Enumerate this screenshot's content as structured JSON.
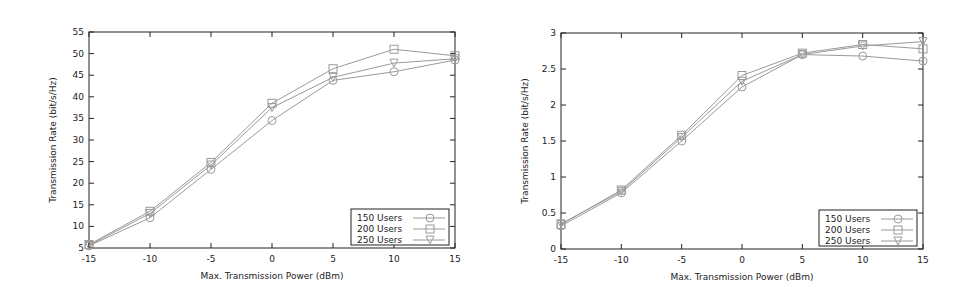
{
  "chart_data": [
    {
      "type": "line",
      "title": "",
      "xlabel": "Max. Transmission Power (dBm)",
      "ylabel": "Transmission Rate (bit/s/Hz)",
      "x": [
        -15,
        -10,
        -5,
        0,
        5,
        10,
        15
      ],
      "xticks": [
        "-15",
        "-10",
        "-5",
        "0",
        "5",
        "10",
        "15"
      ],
      "yticks": [
        "5",
        "10",
        "15",
        "20",
        "25",
        "30",
        "35",
        "40",
        "45",
        "50",
        "55"
      ],
      "xlim": [
        -15,
        15
      ],
      "ylim": [
        5,
        55
      ],
      "grid": false,
      "legend_position": "lower right",
      "series": [
        {
          "name": "150 Users",
          "marker": "circle",
          "values": [
            5.5,
            12.0,
            23.2,
            34.5,
            43.8,
            45.8,
            48.5
          ]
        },
        {
          "name": "200 Users",
          "marker": "square",
          "values": [
            5.8,
            13.5,
            24.8,
            38.5,
            46.5,
            51.0,
            49.5
          ]
        },
        {
          "name": "250 Users",
          "marker": "triangle-down",
          "values": [
            5.6,
            13.0,
            24.2,
            37.5,
            44.5,
            47.8,
            48.8
          ]
        }
      ]
    },
    {
      "type": "line",
      "title": "",
      "xlabel": "Max. Transmission Power (dBm)",
      "ylabel": "Transmission Rate (bit/s/Hz)",
      "x": [
        -15,
        -10,
        -5,
        0,
        5,
        10,
        15
      ],
      "xticks": [
        "-15",
        "-10",
        "-5",
        "0",
        "5",
        "10",
        "15"
      ],
      "yticks": [
        "0",
        "0.5",
        "1",
        "1.5",
        "2",
        "2.5",
        "3"
      ],
      "xlim": [
        -15,
        15
      ],
      "ylim": [
        0,
        3
      ],
      "grid": false,
      "legend_position": "lower right",
      "series": [
        {
          "name": "150 Users",
          "marker": "circle",
          "values": [
            0.32,
            0.78,
            1.5,
            2.25,
            2.7,
            2.68,
            2.61
          ]
        },
        {
          "name": "200 Users",
          "marker": "square",
          "values": [
            0.34,
            0.82,
            1.58,
            2.41,
            2.72,
            2.84,
            2.78
          ]
        },
        {
          "name": "250 Users",
          "marker": "triangle-down",
          "values": [
            0.35,
            0.8,
            1.55,
            2.33,
            2.7,
            2.82,
            2.88
          ]
        }
      ]
    }
  ],
  "colors": {
    "line": "#9a9a9a",
    "frame": "#222222",
    "text": "#222222"
  }
}
